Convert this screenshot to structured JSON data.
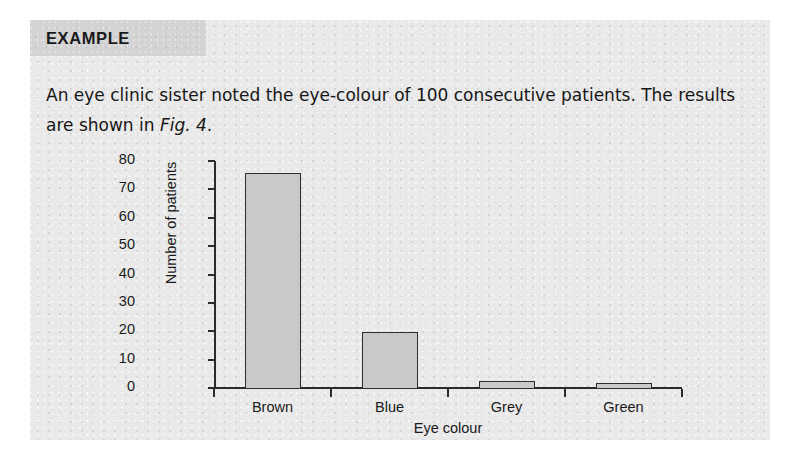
{
  "card": {
    "tab_label": "EXAMPLE",
    "body_text_part1": "An eye clinic sister noted the eye-colour of 100 consecutive patients. The results are shown in ",
    "body_fig_reference": "Fig. 4",
    "body_text_part2": ".",
    "background_color": "#e9e9e9",
    "tab_color": "#d4d4d4"
  },
  "chart_data": {
    "type": "bar",
    "title": "",
    "categories": [
      "Brown",
      "Blue",
      "Grey",
      "Green"
    ],
    "values": [
      76,
      20,
      3,
      2
    ],
    "xlabel": "Eye colour",
    "ylabel": "Number of patients",
    "ylim": [
      0,
      80
    ],
    "yticks": [
      0,
      10,
      20,
      30,
      40,
      50,
      60,
      70,
      80
    ],
    "ytick_labels": [
      "0",
      "10",
      "20",
      "30",
      "40",
      "50",
      "60",
      "70",
      "80"
    ],
    "grid": false,
    "legend": false,
    "bar_fill_color": "#c9c9c9",
    "bar_edge_color": "#2e2e2e",
    "axis_color": "#2b2b2b"
  }
}
